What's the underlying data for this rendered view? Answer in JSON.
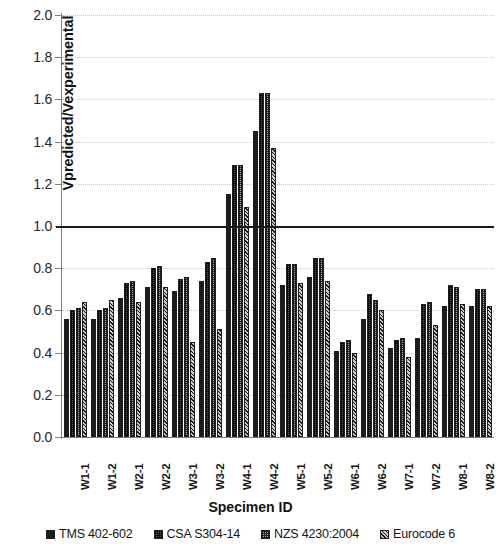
{
  "chart_data": {
    "type": "bar",
    "title": "",
    "xlabel": "Specimen ID",
    "ylabel": "Vpredicted/Vexperimental",
    "ylim": [
      0.0,
      2.0
    ],
    "ytick_step": 0.2,
    "yticks": [
      "2.0",
      "1.8",
      "1.6",
      "1.4",
      "1.2",
      "1.0",
      "0.8",
      "0.6",
      "0.4",
      "0.2",
      "0.0"
    ],
    "grid": true,
    "legend_position": "bottom",
    "reference_line": 1.0,
    "categories": [
      "W1-1",
      "W1-2",
      "W2-1",
      "W2-2",
      "W3-1",
      "W3-2",
      "W4-1",
      "W4-2",
      "W5-1",
      "W5-2",
      "W6-1",
      "W6-2",
      "W7-1",
      "W7-2",
      "W8-1",
      "W8-2"
    ],
    "series": [
      {
        "name": "TMS 402-602",
        "pattern": "solid-black",
        "values": [
          0.56,
          0.56,
          0.66,
          0.71,
          0.69,
          0.74,
          1.15,
          1.45,
          0.72,
          0.76,
          0.41,
          0.56,
          0.42,
          0.47,
          0.62,
          0.62
        ]
      },
      {
        "name": "CSA S304-14",
        "pattern": "dark-dotted",
        "values": [
          0.6,
          0.6,
          0.73,
          0.8,
          0.75,
          0.83,
          1.29,
          1.63,
          0.82,
          0.85,
          0.45,
          0.68,
          0.46,
          0.63,
          0.72,
          0.7
        ]
      },
      {
        "name": "NZS 4230:2004",
        "pattern": "light-checkered",
        "values": [
          0.61,
          0.61,
          0.74,
          0.81,
          0.76,
          0.85,
          1.29,
          1.63,
          0.82,
          0.85,
          0.46,
          0.65,
          0.47,
          0.64,
          0.71,
          0.7
        ]
      },
      {
        "name": "Eurocode 6",
        "pattern": "diagonal-hatch",
        "values": [
          0.64,
          0.65,
          0.64,
          0.71,
          0.45,
          0.51,
          1.09,
          1.37,
          0.73,
          0.74,
          0.4,
          0.6,
          0.38,
          0.53,
          0.63,
          0.62
        ]
      }
    ]
  },
  "colors": {
    "series0": "#1c1c1c",
    "series1": "#5a5a5a",
    "series2": "#aeaeae",
    "series3": "#8f8f8f",
    "grid": "#d9d9d9",
    "axis": "#7f7f7f",
    "reference_line": "#1a1a1a",
    "background": "#ffffff"
  }
}
